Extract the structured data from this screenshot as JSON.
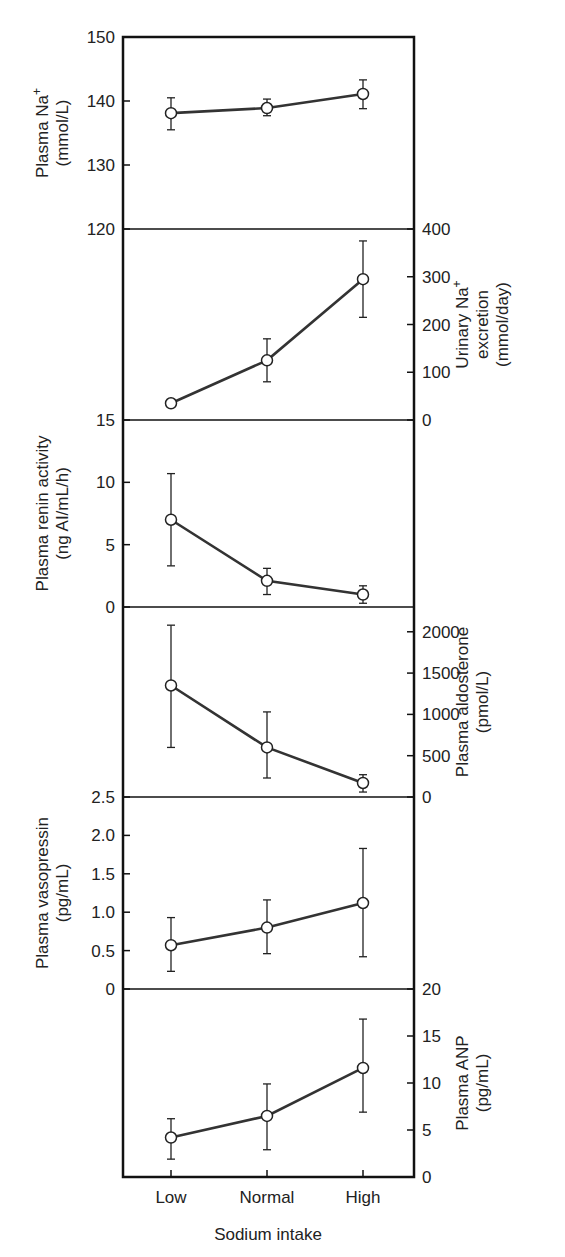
{
  "chart_data": [
    {
      "type": "line",
      "panel": 1,
      "title": "",
      "ylabel": "Plasma Na+ (mmol/L)",
      "ylabel_lines": [
        "Plasma Na",
        "(mmol/L)"
      ],
      "ylabel_superscript": "+",
      "axis_side": "left",
      "ylim": [
        120,
        150
      ],
      "yticks": [
        120,
        130,
        140,
        150
      ],
      "categories": [
        "Low",
        "Normal",
        "High"
      ],
      "values": [
        138.1,
        138.9,
        141.1
      ],
      "error_low": [
        135.5,
        137.7,
        138.8
      ],
      "error_high": [
        140.5,
        140.3,
        143.3
      ]
    },
    {
      "type": "line",
      "panel": 2,
      "ylabel": "Urinary Na+ excretion (mmol/day)",
      "ylabel_lines": [
        "Urinary Na",
        "excretion",
        "(mmol/day)"
      ],
      "ylabel_superscript": "+",
      "axis_side": "right",
      "ylim": [
        0,
        400
      ],
      "yticks": [
        0,
        100,
        200,
        300,
        400
      ],
      "categories": [
        "Low",
        "Normal",
        "High"
      ],
      "values": [
        35,
        125,
        295
      ],
      "error_low": [
        35,
        80,
        215
      ],
      "error_high": [
        35,
        170,
        375
      ]
    },
    {
      "type": "line",
      "panel": 3,
      "ylabel": "Plasma renin activity (ng AI/mL/h)",
      "ylabel_lines": [
        "Plasma renin activity",
        "(ng AI/mL/h)"
      ],
      "axis_side": "left",
      "ylim": [
        0,
        15
      ],
      "yticks": [
        0,
        5,
        10,
        15
      ],
      "categories": [
        "Low",
        "Normal",
        "High"
      ],
      "values": [
        7.0,
        2.1,
        1.0
      ],
      "error_low": [
        3.3,
        1.0,
        0.3
      ],
      "error_high": [
        10.7,
        3.1,
        1.7
      ]
    },
    {
      "type": "line",
      "panel": 4,
      "ylabel": "Plasma aldosterone (pmol/L)",
      "ylabel_lines": [
        "Plasma aldosterone",
        "(pmol/L)"
      ],
      "axis_side": "right",
      "ylim": [
        0,
        2300
      ],
      "yticks": [
        0,
        500,
        1000,
        1500,
        2000
      ],
      "categories": [
        "Low",
        "Normal",
        "High"
      ],
      "values": [
        1350,
        600,
        170
      ],
      "error_low": [
        600,
        230,
        60
      ],
      "error_high": [
        2080,
        1030,
        270
      ]
    },
    {
      "type": "line",
      "panel": 5,
      "ylabel": "Plasma vasopressin (pg/mL)",
      "ylabel_lines": [
        "Plasma vasopressin",
        "(pg/mL)"
      ],
      "axis_side": "left",
      "ylim": [
        0,
        2.5
      ],
      "yticks": [
        "0",
        "0.5",
        "1.0",
        "1.5",
        "2.0",
        "2.5"
      ],
      "categories": [
        "Low",
        "Normal",
        "High"
      ],
      "values": [
        0.57,
        0.8,
        1.12
      ],
      "error_low": [
        0.23,
        0.46,
        0.42
      ],
      "error_high": [
        0.93,
        1.16,
        1.83
      ]
    },
    {
      "type": "line",
      "panel": 6,
      "ylabel": "Plasma ANP (pg/mL)",
      "ylabel_lines": [
        "Plasma ANP",
        "(pg/mL)"
      ],
      "axis_side": "right",
      "ylim": [
        0,
        20
      ],
      "yticks": [
        0,
        5,
        10,
        15,
        20
      ],
      "categories": [
        "Low",
        "Normal",
        "High"
      ],
      "values": [
        4.2,
        6.5,
        11.6
      ],
      "error_low": [
        1.9,
        2.9,
        6.9
      ],
      "error_high": [
        6.2,
        9.9,
        16.8
      ]
    }
  ],
  "xaxis": {
    "categories": [
      "Low",
      "Normal",
      "High"
    ],
    "xlabel": "Sodium intake"
  }
}
